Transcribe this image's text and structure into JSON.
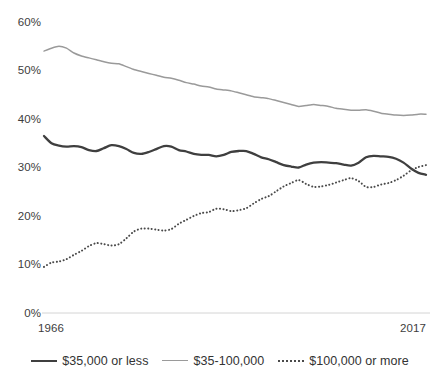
{
  "chart_data": {
    "type": "line",
    "title": "",
    "xlabel": "",
    "ylabel": "",
    "xlim": [
      1966,
      2017
    ],
    "ylim": [
      0,
      60
    ],
    "ytick_labels": [
      "0%",
      "10%",
      "20%",
      "30%",
      "40%",
      "50%",
      "60%"
    ],
    "ytick_values": [
      0,
      10,
      20,
      30,
      40,
      50,
      60
    ],
    "xtick_labels": [
      "1966",
      "2017"
    ],
    "xtick_values": [
      1966,
      2017
    ],
    "grid": false,
    "legend_position": "bottom",
    "x": [
      1966,
      1967,
      1968,
      1969,
      1970,
      1971,
      1972,
      1973,
      1974,
      1975,
      1976,
      1977,
      1978,
      1979,
      1980,
      1981,
      1982,
      1983,
      1984,
      1985,
      1986,
      1987,
      1988,
      1989,
      1990,
      1991,
      1992,
      1993,
      1994,
      1995,
      1996,
      1997,
      1998,
      1999,
      2000,
      2001,
      2002,
      2003,
      2004,
      2005,
      2006,
      2007,
      2008,
      2009,
      2010,
      2011,
      2012,
      2013,
      2014,
      2015,
      2016,
      2017
    ],
    "series": [
      {
        "name": "$35,000 or less",
        "color": "#3f3f3f",
        "style": "solid",
        "values": [
          36.5,
          35.0,
          34.5,
          34.3,
          34.4,
          34.2,
          33.6,
          33.4,
          34.0,
          34.6,
          34.4,
          33.8,
          33.0,
          32.8,
          33.2,
          33.8,
          34.4,
          34.3,
          33.6,
          33.3,
          32.8,
          32.6,
          32.6,
          32.3,
          32.6,
          33.2,
          33.4,
          33.4,
          32.8,
          32.1,
          31.7,
          31.1,
          30.5,
          30.2,
          30.0,
          30.6,
          31.0,
          31.1,
          31.0,
          30.9,
          30.6,
          30.4,
          31.0,
          32.1,
          32.4,
          32.3,
          32.2,
          31.8,
          31.0,
          29.8,
          28.9,
          28.5
        ]
      },
      {
        "name": "$35-100,000",
        "color": "#9a9a9a",
        "style": "solid",
        "values": [
          54.0,
          54.6,
          55.0,
          54.6,
          53.6,
          53.0,
          52.6,
          52.2,
          51.8,
          51.5,
          51.4,
          50.8,
          50.2,
          49.8,
          49.4,
          49.0,
          48.6,
          48.4,
          48.0,
          47.5,
          47.2,
          46.8,
          46.6,
          46.2,
          46.0,
          45.8,
          45.4,
          45.0,
          44.6,
          44.4,
          44.2,
          43.8,
          43.4,
          43.0,
          42.6,
          42.8,
          43.0,
          42.8,
          42.6,
          42.2,
          42.0,
          41.8,
          41.8,
          41.9,
          41.6,
          41.2,
          41.0,
          40.8,
          40.7,
          40.8,
          41.0,
          41.0
        ]
      },
      {
        "name": "$100,000 or more",
        "color": "#4a4a4a",
        "style": "dotted",
        "values": [
          9.5,
          10.4,
          10.6,
          11.1,
          12.0,
          12.8,
          13.8,
          14.4,
          14.2,
          13.9,
          14.2,
          15.4,
          16.8,
          17.4,
          17.4,
          17.2,
          17.0,
          17.3,
          18.4,
          19.2,
          20.0,
          20.6,
          20.8,
          21.5,
          21.4,
          21.0,
          21.2,
          21.6,
          22.6,
          23.5,
          24.1,
          25.1,
          26.1,
          26.8,
          27.4,
          26.6,
          26.0,
          26.1,
          26.4,
          26.9,
          27.4,
          27.8,
          27.2,
          26.0,
          26.0,
          26.5,
          26.8,
          27.4,
          28.3,
          29.4,
          30.1,
          30.5
        ]
      }
    ]
  },
  "axes": {
    "y_labels": [
      "60%",
      "50%",
      "40%",
      "30%",
      "20%",
      "10%",
      "0%"
    ],
    "x_start_label": "1966",
    "x_end_label": "2017"
  },
  "legend": {
    "items": [
      {
        "label": "$35,000 or less",
        "swatch": "solid-dark"
      },
      {
        "label": "$35-100,000",
        "swatch": "solid-gray"
      },
      {
        "label": "$100,000 or more",
        "swatch": "dotted-dark"
      }
    ]
  },
  "colors": {
    "lower_income_line": "#3f3f3f",
    "middle_income_line": "#9a9a9a",
    "upper_income_line": "#4a4a4a",
    "axis_line": "#d4d4d4",
    "background": "#ffffff"
  }
}
